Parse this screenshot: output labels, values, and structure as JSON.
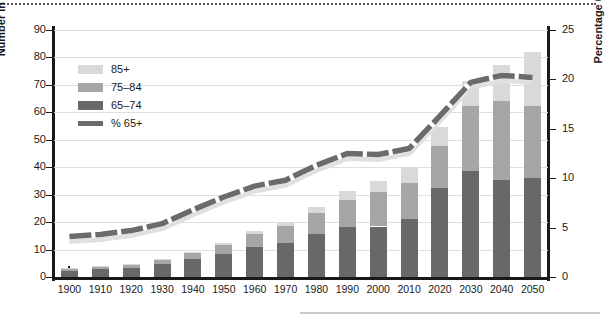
{
  "chart_data": {
    "type": "bar",
    "title": "",
    "subtitle": "",
    "xlabel": "",
    "ylabel": "Number in millions (bars)",
    "ylabel_right": "Percentage 65 and older",
    "categories": [
      "1900",
      "1910",
      "1920",
      "1930",
      "1940",
      "1950",
      "1960",
      "1970",
      "1980",
      "1990",
      "2000",
      "2010",
      "2020",
      "2030",
      "2040",
      "2050"
    ],
    "ylim": [
      0,
      90
    ],
    "yticks": [
      0,
      10,
      20,
      30,
      40,
      50,
      60,
      70,
      80,
      90
    ],
    "ylim_right": [
      0,
      25
    ],
    "yticks_right": [
      0,
      5,
      10,
      15,
      20,
      25
    ],
    "grid": true,
    "legend_position": "upper-left",
    "stacked": true,
    "series": [
      {
        "name": "65-74",
        "type": "bar",
        "color": "#686868",
        "values": [
          2.2,
          2.8,
          3.4,
          4.7,
          6.4,
          8.4,
          11.0,
          12.5,
          15.6,
          18.1,
          18.4,
          21.3,
          32.3,
          38.8,
          35.4,
          36.2
        ]
      },
      {
        "name": "75-84",
        "type": "bar",
        "color": "#a6a6a6",
        "values": [
          0.8,
          1.0,
          1.3,
          1.6,
          2.2,
          3.3,
          4.6,
          6.1,
          7.7,
          10.1,
          12.4,
          13.1,
          15.5,
          23.6,
          28.9,
          26.2
        ]
      },
      {
        "name": "85+",
        "type": "bar",
        "color": "#d9d9d9",
        "values": [
          0.1,
          0.2,
          0.2,
          0.4,
          0.4,
          0.7,
          1.1,
          1.5,
          2.2,
          3.0,
          4.2,
          5.8,
          6.8,
          9.1,
          12.9,
          19.6
        ]
      },
      {
        "name": "% 65+",
        "type": "line",
        "axis": "right",
        "color": "#6b6b6b",
        "values": [
          4.1,
          4.3,
          4.7,
          5.4,
          6.8,
          8.1,
          9.2,
          9.8,
          11.3,
          12.5,
          12.4,
          13.0,
          16.3,
          19.7,
          20.4,
          20.2
        ]
      }
    ],
    "bar_totals": [
      3.1,
      4.0,
      4.9,
      6.7,
      9.0,
      12.4,
      16.7,
      20.1,
      25.5,
      31.2,
      35.0,
      40.2,
      54.6,
      71.5,
      77.2,
      82.0
    ]
  },
  "legend": {
    "items": [
      {
        "label": "85+",
        "color": "#d9d9d9",
        "kind": "swatch"
      },
      {
        "label": "75–84",
        "color": "#a6a6a6",
        "kind": "swatch"
      },
      {
        "label": "65–74",
        "color": "#686868",
        "kind": "swatch"
      },
      {
        "label": "% 65+",
        "color": "#6b6b6b",
        "kind": "line"
      }
    ]
  },
  "colors": {
    "axis": "#1a1a1a",
    "grid": "#dfdfdf",
    "band_85": "#d9d9d9",
    "band_75": "#a6a6a6",
    "band_65": "#686868",
    "line_dark": "#6b6b6b",
    "line_light": "#e0e0e0",
    "background": "#ffffff"
  }
}
